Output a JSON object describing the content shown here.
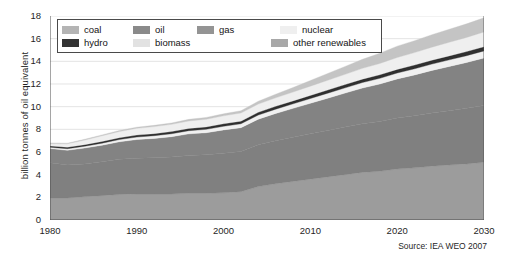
{
  "chart_data": {
    "type": "area",
    "title": "",
    "subtitle": "",
    "xlabel": "",
    "ylabel": "billion tonnes of oil equivalent",
    "xlim": [
      1980,
      2030
    ],
    "ylim": [
      0,
      18
    ],
    "ytick_step": 2,
    "yticks": [
      0,
      2,
      4,
      6,
      8,
      10,
      12,
      14,
      16,
      18
    ],
    "xticks": [
      1980,
      1990,
      2000,
      2010,
      2020,
      2030
    ],
    "grid": true,
    "legend_position": "top-left",
    "stacked": true,
    "stack_order_bottom_to_top": [
      "coal",
      "oil",
      "gas",
      "biomass",
      "hydro",
      "nuclear",
      "other renewables"
    ],
    "x": [
      1980,
      1982,
      1984,
      1986,
      1988,
      1990,
      1992,
      1994,
      1996,
      1998,
      2000,
      2002,
      2004,
      2006,
      2008,
      2010,
      2012,
      2014,
      2016,
      2018,
      2020,
      2022,
      2024,
      2026,
      2028,
      2030
    ],
    "series": [
      {
        "name": "coal",
        "color": "#9c9c9c",
        "values": [
          1.95,
          1.95,
          2.05,
          2.15,
          2.25,
          2.3,
          2.3,
          2.3,
          2.35,
          2.35,
          2.4,
          2.5,
          2.95,
          3.2,
          3.4,
          3.6,
          3.8,
          4.0,
          4.2,
          4.3,
          4.5,
          4.6,
          4.75,
          4.85,
          4.95,
          5.1
        ]
      },
      {
        "name": "oil",
        "color": "#808080",
        "values": [
          3.1,
          2.9,
          2.9,
          3.0,
          3.1,
          3.15,
          3.2,
          3.25,
          3.35,
          3.4,
          3.5,
          3.55,
          3.7,
          3.8,
          3.9,
          4.0,
          4.1,
          4.2,
          4.3,
          4.4,
          4.5,
          4.6,
          4.7,
          4.8,
          4.9,
          5.0
        ]
      },
      {
        "name": "gas",
        "color": "#838383",
        "values": [
          1.25,
          1.3,
          1.4,
          1.45,
          1.55,
          1.65,
          1.7,
          1.8,
          1.9,
          1.95,
          2.05,
          2.1,
          2.25,
          2.4,
          2.55,
          2.7,
          2.85,
          3.0,
          3.15,
          3.3,
          3.45,
          3.6,
          3.75,
          3.9,
          4.05,
          4.2
        ]
      },
      {
        "name": "biomass",
        "color": "#f0f0f0",
        "values": [
          0.12,
          0.14,
          0.16,
          0.18,
          0.2,
          0.22,
          0.24,
          0.26,
          0.28,
          0.3,
          0.32,
          0.34,
          0.36,
          0.38,
          0.4,
          0.42,
          0.44,
          0.46,
          0.48,
          0.5,
          0.52,
          0.54,
          0.56,
          0.58,
          0.6,
          0.62
        ]
      },
      {
        "name": "hydro",
        "color": "#303030",
        "values": [
          0.12,
          0.13,
          0.14,
          0.15,
          0.16,
          0.17,
          0.18,
          0.19,
          0.2,
          0.21,
          0.22,
          0.23,
          0.24,
          0.25,
          0.26,
          0.27,
          0.28,
          0.29,
          0.3,
          0.31,
          0.32,
          0.33,
          0.34,
          0.35,
          0.36,
          0.37
        ]
      },
      {
        "name": "nuclear",
        "color": "#efefef",
        "values": [
          0.2,
          0.3,
          0.4,
          0.5,
          0.55,
          0.6,
          0.62,
          0.64,
          0.66,
          0.68,
          0.7,
          0.72,
          0.73,
          0.75,
          0.78,
          0.82,
          0.86,
          0.9,
          0.95,
          1.0,
          1.05,
          1.1,
          1.15,
          1.2,
          1.25,
          1.3
        ]
      },
      {
        "name": "other renewables",
        "color": "#c4c4c4",
        "values": [
          0.06,
          0.06,
          0.07,
          0.08,
          0.09,
          0.1,
          0.11,
          0.12,
          0.14,
          0.16,
          0.18,
          0.2,
          0.25,
          0.32,
          0.4,
          0.5,
          0.6,
          0.7,
          0.8,
          0.9,
          1.0,
          1.05,
          1.1,
          1.15,
          1.2,
          1.25
        ]
      }
    ],
    "totals": [
      6.8,
      6.78,
      7.12,
      7.51,
      7.9,
      8.19,
      8.35,
      8.56,
      8.88,
      9.05,
      9.37,
      9.64,
      10.48,
      11.1,
      11.69,
      12.31,
      12.93,
      13.55,
      14.18,
      14.71,
      15.34,
      15.82,
      16.35,
      16.83,
      17.31,
      17.84
    ]
  },
  "legend": {
    "row1": [
      {
        "label": "coal",
        "color": "#b4b4b4"
      },
      {
        "label": "oil",
        "color": "#8a8a8a"
      },
      {
        "label": "gas",
        "color": "#949494"
      },
      {
        "label": "nuclear",
        "color": "#efefef"
      }
    ],
    "row2": [
      {
        "label": "hydro",
        "color": "#333333"
      },
      {
        "label": "biomass",
        "color": "#e2e2e2"
      },
      {
        "label": "other renewables",
        "color": "#a8a8a8"
      }
    ]
  },
  "axes": {
    "ylabel": "billion tonnes of oil equivalent",
    "yticks": [
      "18",
      "16",
      "14",
      "12",
      "10",
      "8",
      "6",
      "4",
      "2",
      "0"
    ],
    "xticks": [
      "1980",
      "1990",
      "2000",
      "2010",
      "2020",
      "2030"
    ]
  },
  "source": {
    "text": "Source: IEA WEO 2007"
  }
}
